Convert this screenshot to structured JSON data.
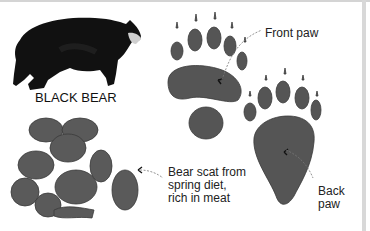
{
  "labels": {
    "bear": "BLACK BEAR",
    "front_paw": "Front paw",
    "back_paw_line1": "Back",
    "back_paw_line2": "paw",
    "scat_line1": "Bear scat from",
    "scat_line2": "spring diet,",
    "scat_line3": "rich in meat"
  },
  "colors": {
    "bear": "#111111",
    "paw": "#555555",
    "scat": "#5a5a5a",
    "frame": "#d6d6d6"
  }
}
